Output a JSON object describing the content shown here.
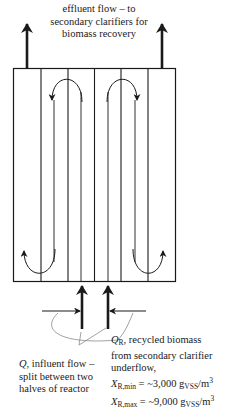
{
  "diagram": {
    "type": "activated sludge plug-flow reactor schematic",
    "colors": {
      "stroke": "#1a1a1a",
      "callout": "#8a8a8a",
      "background": "#ffffff"
    },
    "effluent_label": {
      "line1": "effluent flow – to",
      "line2": "secondary clarifiers for",
      "line3": "biomass recovery"
    },
    "influent_label": {
      "symbol": "Q",
      "line1_rest": ", influent flow –",
      "line2": "split between two",
      "line3": "halves of reactor"
    },
    "recycle_label": {
      "symbol": "Q",
      "symbol_sub": "R",
      "line1_rest": ", recycled biomass",
      "line2": "from secondary clarifier",
      "line3": "underflow,",
      "xmin_symbol": "X",
      "xmin_sub": "R,min",
      "xmin_eq": " = ~3,000 g",
      "xmin_unit_sub": "VSS",
      "xmin_unit": "/m",
      "xmin_unit_sup": "3",
      "xmax_symbol": "X",
      "xmax_sub": "R,max",
      "xmax_eq": " = ~9,000 g",
      "xmax_unit_sub": "VSS",
      "xmax_unit": "/m",
      "xmax_unit_sup": "3"
    }
  }
}
